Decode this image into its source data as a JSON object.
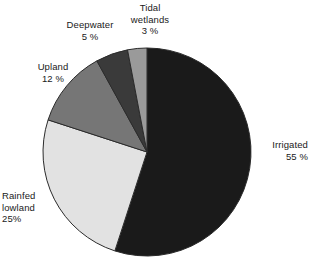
{
  "chart_data": {
    "type": "pie",
    "title": "",
    "subtitle": "",
    "xlabel": "",
    "ylabel": "",
    "legend_position": "none",
    "grid": false,
    "units": "percent",
    "start_angle_deg": 0,
    "direction": "clockwise",
    "categories": [
      "Irrigated",
      "Rainfed lowland",
      "Upland",
      "Deepwater",
      "Tidal wetlands"
    ],
    "values": [
      55,
      25,
      12,
      5,
      3
    ],
    "slices": [
      {
        "name": "Irrigated",
        "label_text": "Irrigated",
        "value": 55,
        "value_text": "55 %",
        "color": "#1a1a1a",
        "label_position": "right"
      },
      {
        "name": "Rainfed lowland",
        "label_text": "Rainfed\nlowland",
        "value": 25,
        "value_text": "25%",
        "color": "#e2e2e2",
        "label_position": "lower-left"
      },
      {
        "name": "Upland",
        "label_text": "Upland",
        "value": 12,
        "value_text": "12 %",
        "color": "#767676",
        "label_position": "left"
      },
      {
        "name": "Deepwater",
        "label_text": "Deepwater",
        "value": 5,
        "value_text": "5 %",
        "color": "#3a3a3a",
        "label_position": "upper-left"
      },
      {
        "name": "Tidal wetlands",
        "label_text": "Tidal\nwetlands",
        "value": 3,
        "value_text": "3 %",
        "color": "#9a9a9a",
        "label_position": "top"
      }
    ]
  },
  "labels": {
    "irrigated": "Irrigated\n55 %",
    "rainfed_lowland": "Rainfed\nlowland\n25%",
    "upland": "Upland\n12 %",
    "deepwater": "Deepwater\n5 %",
    "tidal_wetlands": "Tidal\nwetlands\n3 %"
  },
  "colors": {
    "irrigated": "#1a1a1a",
    "rainfed_lowland": "#e2e2e2",
    "upland": "#767676",
    "deepwater": "#3a3a3a",
    "tidal_wetlands": "#9a9a9a",
    "outline": "#2b2b2b",
    "background": "#ffffff",
    "text": "#1a1a1a"
  },
  "geometry": {
    "center_x": 147,
    "center_y": 152,
    "radius": 104
  }
}
